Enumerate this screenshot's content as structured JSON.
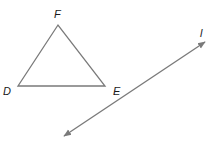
{
  "diagram": {
    "type": "geometry",
    "triangle": {
      "vertices": [
        {
          "name": "D",
          "x": 18,
          "y": 86
        },
        {
          "name": "E",
          "x": 105,
          "y": 86
        },
        {
          "name": "F",
          "x": 58,
          "y": 25
        }
      ],
      "labels": {
        "D": "D",
        "E": "E",
        "F": "F"
      },
      "stroke": "#7a7a7a"
    },
    "line": {
      "name": "l",
      "label": "l",
      "start": {
        "x": 64,
        "y": 136
      },
      "end": {
        "x": 205,
        "y": 42
      },
      "arrows": "both",
      "stroke": "#7a7a7a"
    }
  }
}
